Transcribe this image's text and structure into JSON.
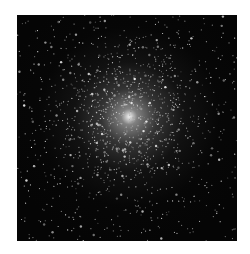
{
  "image": {
    "subject": "globular star cluster",
    "background_color": "#ffffff",
    "sky_color": "#050505",
    "core_color": "#f2f2f2",
    "frame": {
      "left": 17,
      "top": 15,
      "width": 220,
      "height": 226
    },
    "core_center_pct": [
      51,
      45
    ],
    "star_count": 1400
  }
}
